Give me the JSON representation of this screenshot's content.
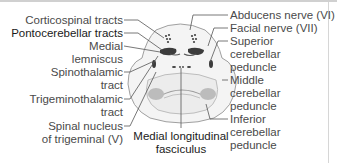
{
  "diagram": {
    "left_labels": [
      {
        "id": "corticospinal",
        "lines": [
          "Corticospinal tracts"
        ]
      },
      {
        "id": "pontocerebellar",
        "lines": [
          "Pontocerebellar tracts"
        ]
      },
      {
        "id": "medial_lemniscus",
        "lines": [
          "Medial",
          "lemniscus"
        ]
      },
      {
        "id": "spinothalamic",
        "lines": [
          "Spinothalamic",
          "tract"
        ]
      },
      {
        "id": "trigeminothalamic",
        "lines": [
          "Trigeminothalamic",
          "tract"
        ]
      },
      {
        "id": "spinal_nucleus_trigeminal",
        "lines": [
          "Spinal nucleus",
          "of trigeminal (V)"
        ]
      }
    ],
    "right_labels": [
      {
        "id": "abducens",
        "lines": [
          "Abducens nerve (VI)"
        ]
      },
      {
        "id": "facial",
        "lines": [
          "Facial nerve (VII)"
        ]
      },
      {
        "id": "superior_cerebellar_peduncle",
        "lines": [
          "Superior",
          "cerebellar",
          "peduncle"
        ]
      },
      {
        "id": "middle_cerebellar_peduncle",
        "lines": [
          "Middle",
          "cerebellar",
          "peduncle"
        ]
      },
      {
        "id": "inferior_cerebellar_peduncle",
        "lines": [
          "Inferior",
          "cerebellar",
          "peduncle"
        ]
      }
    ],
    "bottom_labels": [
      {
        "id": "mlf",
        "lines": [
          "Medial longitudinal",
          "fasciculus"
        ]
      }
    ],
    "colors": {
      "outline": "#9a9a9a",
      "fill": "#f2f2f2",
      "tract_dark": "#3c3c3c",
      "peduncle": "#bdbdbd",
      "leader": "#555555",
      "text": "#4a4a4a"
    }
  }
}
